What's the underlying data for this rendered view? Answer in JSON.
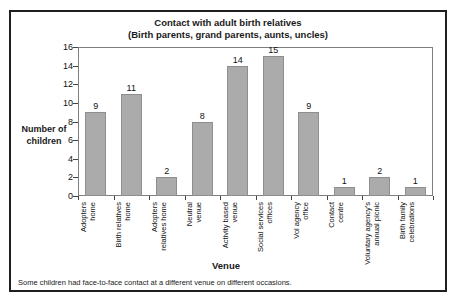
{
  "chart_data": {
    "type": "bar",
    "title": "Contact with adult birth relatives",
    "subtitle": "(Birth parents, grand parents, aunts, uncles)",
    "categories": [
      "Adopters home",
      "Birth relatives home",
      "Adopters relatives home",
      "Neutral venue",
      "Activity based venue",
      "Social services offices",
      "Vol agency office",
      "Contact centre",
      "Voluntary agency's annual picnic",
      "Birth family celebrations"
    ],
    "categories_wrapped": [
      "Adopters\nhome",
      "Birth relatives\nhome",
      "Adopters\nrelatives home",
      "Neutral\nvenue",
      "Activity based\nvenue",
      "Social services\noffices",
      "Vol agency\noffice",
      "Contact\ncentre",
      "Voluntary agency's\nannual picnic",
      "Birth family\ncelebrations"
    ],
    "values": [
      9,
      11,
      2,
      8,
      14,
      15,
      9,
      1,
      2,
      1
    ],
    "xlabel": "Venue",
    "ylabel": "Number of children",
    "ylim": [
      0,
      16
    ],
    "ytick_step": 2,
    "grid": false,
    "legend": "none",
    "data_labels": true,
    "bar_color": "#ababab",
    "bar_border_color": "#8e8e8e"
  },
  "footer": {
    "note": "Some children had face-to-face contact at a different venue on different occasions."
  }
}
